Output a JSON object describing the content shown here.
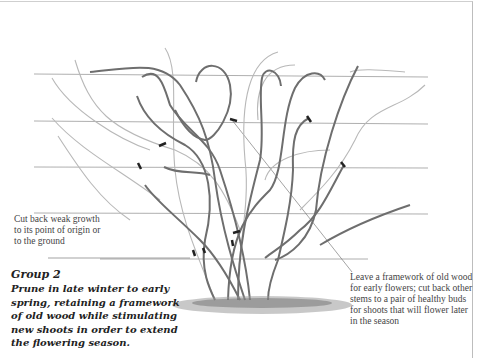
{
  "figure": {
    "group_title": "Group 2",
    "group_description": "Prune in late winter to early spring, retaining a framework of old wood while stimulating new shoots in order to extend the flowering season.",
    "annotations": {
      "left": "Cut back weak growth to its point of origin or to the ground",
      "right": "Leave a framework of old wood for early flowers; cut back other stems to a pair of healthy buds for shoots that will flower later in the season"
    },
    "wire_count": 5,
    "colors": {
      "stem": "#6e6e6e",
      "new_growth": "#b8b8b8",
      "wire": "#9a9a9a",
      "cut_mark": "#222222",
      "ground": "#8a8a8a"
    }
  }
}
